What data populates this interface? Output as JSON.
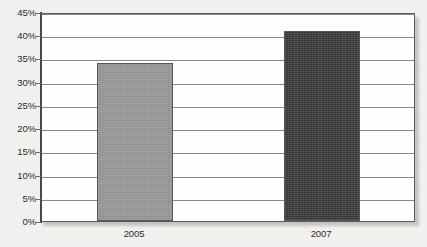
{
  "chart_data": {
    "type": "bar",
    "title": "",
    "subtitle": "",
    "xlabel": "",
    "ylabel": "",
    "categories": [
      "2005",
      "2007"
    ],
    "values": [
      34,
      41
    ],
    "value_labels": [
      "34%",
      "41%"
    ],
    "series": [
      {
        "name": "",
        "values": [
          34,
          41
        ]
      }
    ],
    "ylim": [
      0,
      45
    ],
    "ytick_step": 5,
    "ytick_values": [
      0,
      5,
      10,
      15,
      20,
      25,
      30,
      35,
      40,
      45
    ],
    "ytick_labels": [
      "0%",
      "5%",
      "10%",
      "15%",
      "20%",
      "25%",
      "30%",
      "35%",
      "40%",
      "45%"
    ],
    "grid": true,
    "grid_axis": "y",
    "legend": false,
    "legend_position": "none",
    "annotations": [],
    "bar_colors": [
      "#969696",
      "#3a3a3a"
    ],
    "bar_border_color": "#55555a",
    "plot_background": "#ffffff",
    "page_background": "#f2f1ef",
    "gridline_color": "#8a8a8a",
    "axis_color": "#4a4a4a",
    "text_color": "#2b2b2b"
  },
  "axes": {
    "y_ticks": [
      {
        "label": "45%",
        "value": 45
      },
      {
        "label": "40%",
        "value": 40
      },
      {
        "label": "35%",
        "value": 35
      },
      {
        "label": "30%",
        "value": 30
      },
      {
        "label": "25%",
        "value": 25
      },
      {
        "label": "20%",
        "value": 20
      },
      {
        "label": "15%",
        "value": 15
      },
      {
        "label": "10%",
        "value": 10
      },
      {
        "label": "5%",
        "value": 5
      },
      {
        "label": "0%",
        "value": 0
      }
    ],
    "x_ticks": [
      {
        "label": "2005"
      },
      {
        "label": "2007"
      }
    ]
  }
}
